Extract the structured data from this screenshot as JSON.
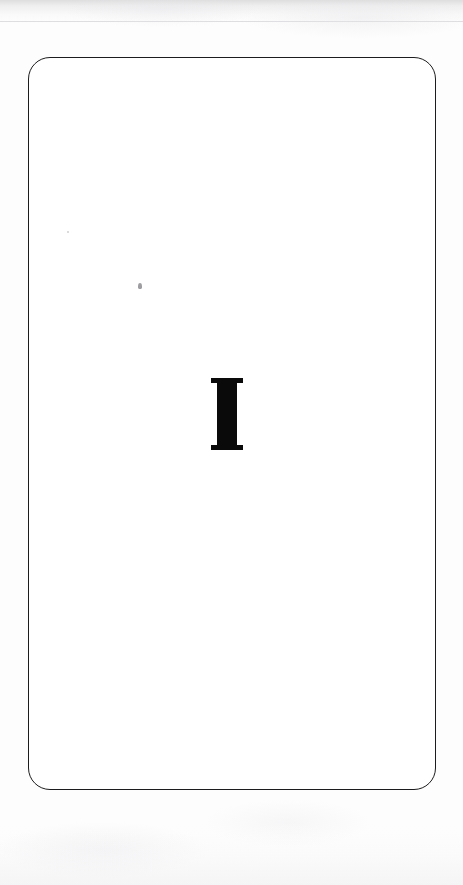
{
  "document": {
    "kind": "scanned-page",
    "page_width": 463,
    "page_height": 885,
    "background_color": "#fdfdfd",
    "page_fill_color": "#ffffff",
    "alt_text": "Scanned blank page with a rounded rectangular border and a single bold serif letter I near the center"
  },
  "frame": {
    "shape": "rounded-rectangle",
    "stroke_color": "#1c1c1e",
    "stroke_width_px": 1.5,
    "corner_radius_px": 22,
    "left_px": 28,
    "top_px": 57,
    "width_px": 408,
    "height_px": 733
  },
  "content": {
    "glyph": {
      "character": "I",
      "description": "bold slab-serif capital I",
      "color": "#0a0a0a",
      "left_px": 211,
      "top_px": 378,
      "width_px": 32,
      "height_px": 72,
      "stem_width_px": 20,
      "serif_thickness_px": 5
    }
  },
  "artifacts": {
    "specks": [
      {
        "name": "speck-primary",
        "left_px": 138,
        "top_px": 283,
        "color": "#78787e"
      },
      {
        "name": "speck-secondary",
        "left_px": 67,
        "top_px": 231,
        "color": "#c4c4c8"
      }
    ],
    "scan_edge_top_color": "#b2b2b4",
    "scan_edge_bottom_color": "#eeeef0"
  }
}
